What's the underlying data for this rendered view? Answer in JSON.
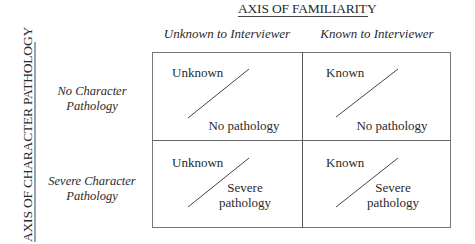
{
  "axes": {
    "horizontal_title": "AXIS OF FAMILIARITY",
    "vertical_title": "AXIS OF CHARACTER PATHOLOGY"
  },
  "columns": [
    {
      "label": "Unknown to Interviewer"
    },
    {
      "label": "Known to Interviewer"
    }
  ],
  "rows": [
    {
      "line1": "No Character",
      "line2": "Pathology"
    },
    {
      "line1": "Severe Character",
      "line2": "Pathology"
    }
  ],
  "cells": [
    {
      "top": "Unknown",
      "bottom_line1": "No pathology",
      "bottom_line2": ""
    },
    {
      "top": "Known",
      "bottom_line1": "No pathology",
      "bottom_line2": ""
    },
    {
      "top": "Unknown",
      "bottom_line1": "Severe",
      "bottom_line2": "pathology"
    },
    {
      "top": "Known",
      "bottom_line1": "Severe",
      "bottom_line2": "pathology"
    }
  ],
  "colors": {
    "text": "#2a2a2a",
    "lines": "#555555",
    "background": "#ffffff"
  }
}
